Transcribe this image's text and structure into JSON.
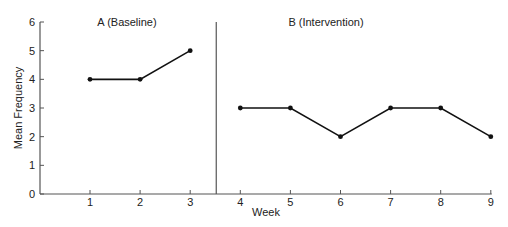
{
  "chart_data": {
    "type": "line",
    "title": "",
    "xlabel": "Week",
    "ylabel": "Mean Frequency",
    "ylim": [
      0,
      6
    ],
    "yticks": [
      0,
      1,
      2,
      3,
      4,
      5,
      6
    ],
    "xticks": [
      1,
      2,
      3,
      4,
      5,
      6,
      7,
      8,
      9
    ],
    "grid": false,
    "phase_line_x": 3.5,
    "phases": [
      {
        "name": "A (Baseline)",
        "x": [
          1,
          2,
          3
        ],
        "values": [
          4,
          4,
          5
        ]
      },
      {
        "name": "B (Intervention)",
        "x": [
          4,
          5,
          6,
          7,
          8,
          9
        ],
        "values": [
          3,
          3,
          2,
          3,
          3,
          2
        ]
      }
    ],
    "colors": {
      "line": "#111111",
      "axis": "#555555"
    }
  }
}
